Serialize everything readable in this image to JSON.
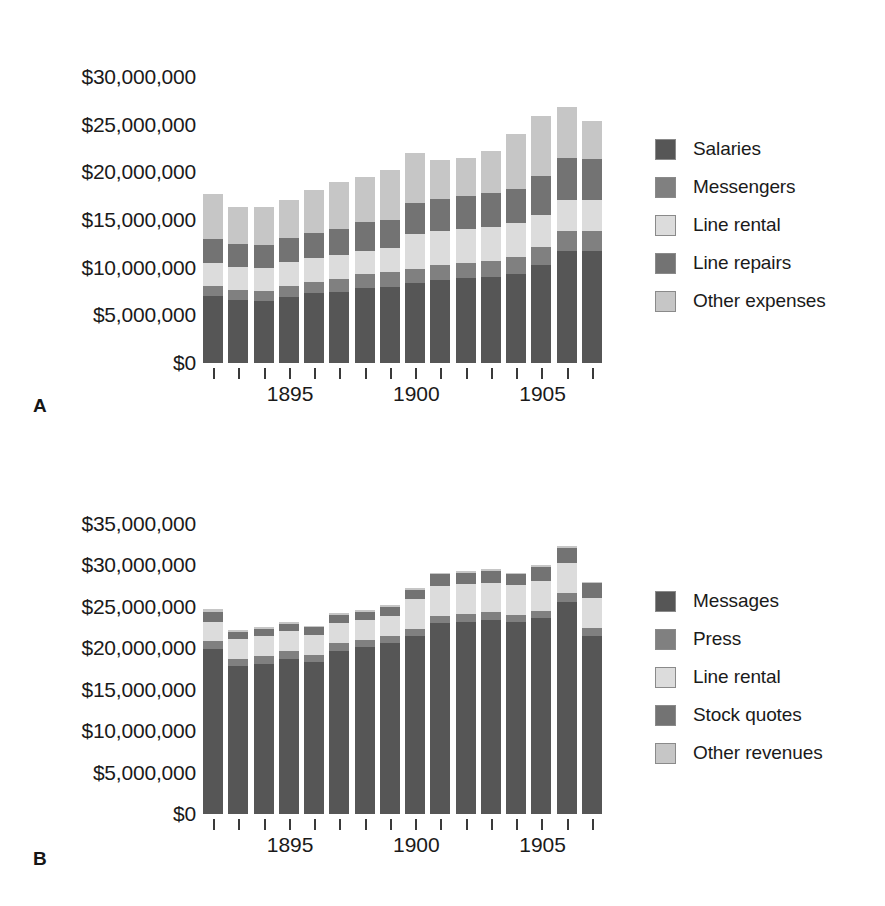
{
  "figure": {
    "panels": [
      {
        "letter": "A",
        "legend_title": "Expenses",
        "yaxis": {
          "ticks": [
            "$0",
            "$5,000,000",
            "$10,000,000",
            "$15,000,000",
            "$20,000,000",
            "$25,000,000",
            "$30,000,000"
          ],
          "max": 32000000,
          "step": 5000000
        },
        "xaxis": {
          "tick_labels": [
            "1895",
            "1900",
            "1905"
          ],
          "label_years": [
            1895,
            1900,
            1905
          ]
        },
        "legend": [
          {
            "label": "Salaries",
            "color": "#565656"
          },
          {
            "label": "Messengers",
            "color": "#808080"
          },
          {
            "label": "Line rental",
            "color": "#dcdcdc"
          },
          {
            "label": "Line repairs",
            "color": "#737373"
          },
          {
            "label": "Other expenses",
            "color": "#c6c6c6"
          }
        ]
      },
      {
        "letter": "B",
        "legend_title": "Revenues",
        "yaxis": {
          "ticks": [
            "$0",
            "$5,000,000",
            "$10,000,000",
            "$15,000,000",
            "$20,000,000",
            "$25,000,000",
            "$30,000,000",
            "$35,000,000"
          ],
          "max": 37000000,
          "step": 5000000
        },
        "xaxis": {
          "tick_labels": [
            "1895",
            "1900",
            "1905"
          ],
          "label_years": [
            1895,
            1900,
            1905
          ]
        },
        "legend": [
          {
            "label": "Messages",
            "color": "#565656"
          },
          {
            "label": "Press",
            "color": "#808080"
          },
          {
            "label": "Line rental",
            "color": "#dcdcdc"
          },
          {
            "label": "Stock quotes",
            "color": "#737373"
          },
          {
            "label": "Other revenues",
            "color": "#c6c6c6"
          }
        ]
      }
    ]
  },
  "chart_data": [
    {
      "type": "bar",
      "stacked": true,
      "panel": "A",
      "title": "Western Union expenses by category",
      "xlabel": "",
      "ylabel": "",
      "ylim": [
        0,
        32000000
      ],
      "yticks": [
        0,
        5000000,
        10000000,
        15000000,
        20000000,
        25000000,
        30000000
      ],
      "ytick_labels": [
        "$0",
        "$5,000,000",
        "$10,000,000",
        "$15,000,000",
        "$20,000,000",
        "$25,000,000",
        "$30,000,000"
      ],
      "grid": false,
      "legend_position": "right",
      "categories": [
        1892,
        1893,
        1894,
        1895,
        1896,
        1897,
        1898,
        1899,
        1900,
        1901,
        1902,
        1903,
        1904,
        1905,
        1906,
        1907
      ],
      "series": [
        {
          "name": "Salaries",
          "color": "#565656",
          "values": [
            7000000,
            6600000,
            6500000,
            6900000,
            7300000,
            7500000,
            7900000,
            8000000,
            8400000,
            8700000,
            8900000,
            9000000,
            9300000,
            10300000,
            11800000,
            11800000
          ]
        },
        {
          "name": "Messengers",
          "color": "#808080",
          "values": [
            1100000,
            1100000,
            1100000,
            1200000,
            1200000,
            1300000,
            1400000,
            1500000,
            1500000,
            1600000,
            1600000,
            1700000,
            1800000,
            1900000,
            2100000,
            2000000
          ]
        },
        {
          "name": "Line rental",
          "color": "#dcdcdc",
          "values": [
            2400000,
            2400000,
            2400000,
            2500000,
            2500000,
            2500000,
            2500000,
            2600000,
            3600000,
            3600000,
            3600000,
            3600000,
            3600000,
            3300000,
            3200000,
            3300000
          ]
        },
        {
          "name": "Line repairs",
          "color": "#737373",
          "values": [
            2500000,
            2400000,
            2400000,
            2500000,
            2600000,
            2800000,
            3000000,
            2900000,
            3300000,
            3300000,
            3400000,
            3500000,
            3600000,
            4100000,
            4400000,
            4300000
          ]
        },
        {
          "name": "Other expenses",
          "color": "#c6c6c6",
          "values": [
            4700000,
            3900000,
            4000000,
            4000000,
            4600000,
            4900000,
            4700000,
            5200000,
            5200000,
            4100000,
            4000000,
            4400000,
            5700000,
            6300000,
            5400000,
            4000000
          ]
        }
      ]
    },
    {
      "type": "bar",
      "stacked": true,
      "panel": "B",
      "title": "Western Union revenues by category",
      "xlabel": "",
      "ylabel": "",
      "ylim": [
        0,
        37000000
      ],
      "yticks": [
        0,
        5000000,
        10000000,
        15000000,
        20000000,
        25000000,
        30000000,
        35000000
      ],
      "ytick_labels": [
        "$0",
        "$5,000,000",
        "$10,000,000",
        "$15,000,000",
        "$20,000,000",
        "$25,000,000",
        "$30,000,000",
        "$35,000,000"
      ],
      "grid": false,
      "legend_position": "right",
      "categories": [
        1892,
        1893,
        1894,
        1895,
        1896,
        1897,
        1898,
        1899,
        1900,
        1901,
        1902,
        1903,
        1904,
        1905,
        1906,
        1907
      ],
      "series": [
        {
          "name": "Messages",
          "color": "#565656",
          "values": [
            19900000,
            17800000,
            18100000,
            18700000,
            18300000,
            19700000,
            20100000,
            20600000,
            21400000,
            23000000,
            23200000,
            23400000,
            23100000,
            23600000,
            25600000,
            21400000
          ]
        },
        {
          "name": "Press",
          "color": "#808080",
          "values": [
            900000,
            900000,
            900000,
            900000,
            900000,
            900000,
            900000,
            900000,
            900000,
            900000,
            900000,
            900000,
            900000,
            900000,
            1000000,
            1000000
          ]
        },
        {
          "name": "Line rental",
          "color": "#dcdcdc",
          "values": [
            2400000,
            2400000,
            2400000,
            2400000,
            2400000,
            2400000,
            2400000,
            2400000,
            3600000,
            3600000,
            3600000,
            3600000,
            3600000,
            3600000,
            3600000,
            3600000
          ]
        },
        {
          "name": "Stock quotes",
          "color": "#737373",
          "values": [
            1200000,
            900000,
            900000,
            900000,
            900000,
            1000000,
            1000000,
            1100000,
            1100000,
            1400000,
            1400000,
            1400000,
            1300000,
            1700000,
            1900000,
            1800000
          ]
        },
        {
          "name": "Other revenues",
          "color": "#c6c6c6",
          "values": [
            300000,
            200000,
            200000,
            200000,
            200000,
            200000,
            200000,
            200000,
            200000,
            200000,
            200000,
            200000,
            200000,
            200000,
            200000,
            200000
          ]
        }
      ]
    }
  ]
}
